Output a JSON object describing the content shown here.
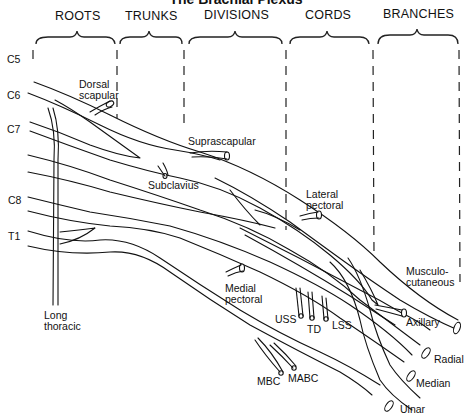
{
  "title": "The Brachial Plexus",
  "sections": [
    {
      "label": "ROOTS"
    },
    {
      "label": "TRUNKS"
    },
    {
      "label": "DIVISIONS"
    },
    {
      "label": "CORDS"
    },
    {
      "label": "BRANCHES"
    }
  ],
  "roots": [
    {
      "label": "C5"
    },
    {
      "label": "C6"
    },
    {
      "label": "C7"
    },
    {
      "label": "C8"
    },
    {
      "label": "T1"
    }
  ],
  "nerves": {
    "dorsal_scapular": "Dorsal\nscapular",
    "suprascapular": "Suprascapular",
    "subclavius": "Subclavius",
    "lateral_pectoral": "Lateral\npectoral",
    "long_thoracic": "Long\nthoracic",
    "medial_pectoral": "Medial\npectoral",
    "uss": "USS",
    "td": "TD",
    "lss": "LSS",
    "mbc": "MBC",
    "mabc": "MABC",
    "musculocutaneous": "Musculo-\ncutaneous",
    "axillary": "Axillary",
    "radial": "Radial",
    "median": "Median",
    "ulnar": "Ulnar"
  }
}
